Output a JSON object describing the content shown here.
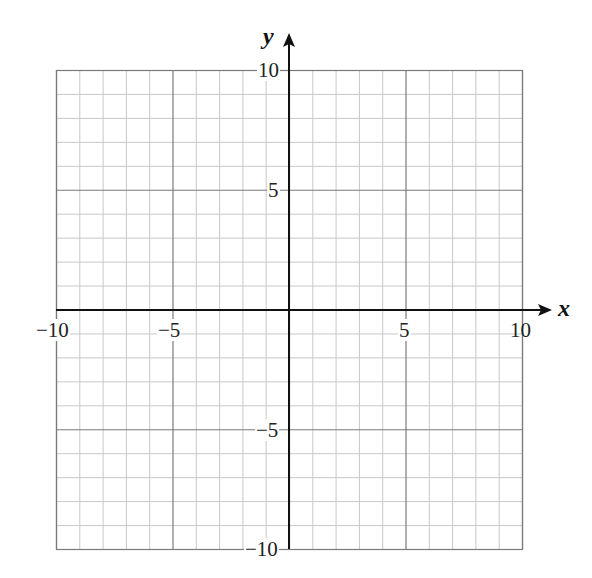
{
  "chart_data": {
    "type": "scatter",
    "title": "",
    "xlabel": "x",
    "ylabel": "y",
    "xlim": [
      -10,
      10
    ],
    "ylim": [
      -10,
      10
    ],
    "grid": true,
    "grid_minor_step": 1,
    "grid_major_step": 5,
    "x_ticks": [
      -10,
      -5,
      5,
      10
    ],
    "y_ticks": [
      10,
      5,
      -5,
      -10
    ],
    "x_tick_labels": [
      "−10",
      "−5",
      "5",
      "10"
    ],
    "y_tick_labels": [
      "10",
      "5",
      "−5",
      "−10"
    ],
    "series": [],
    "legend": null
  },
  "labels": {
    "x_axis": "x",
    "y_axis": "y",
    "x_ticks": [
      "−10",
      "−5",
      "5",
      "10"
    ],
    "y_ticks": [
      "10",
      "5",
      "−5",
      "−10"
    ]
  },
  "colors": {
    "minor_grid": "#c8c8c8",
    "major_grid": "#7a7a7a",
    "axis": "#111111"
  }
}
